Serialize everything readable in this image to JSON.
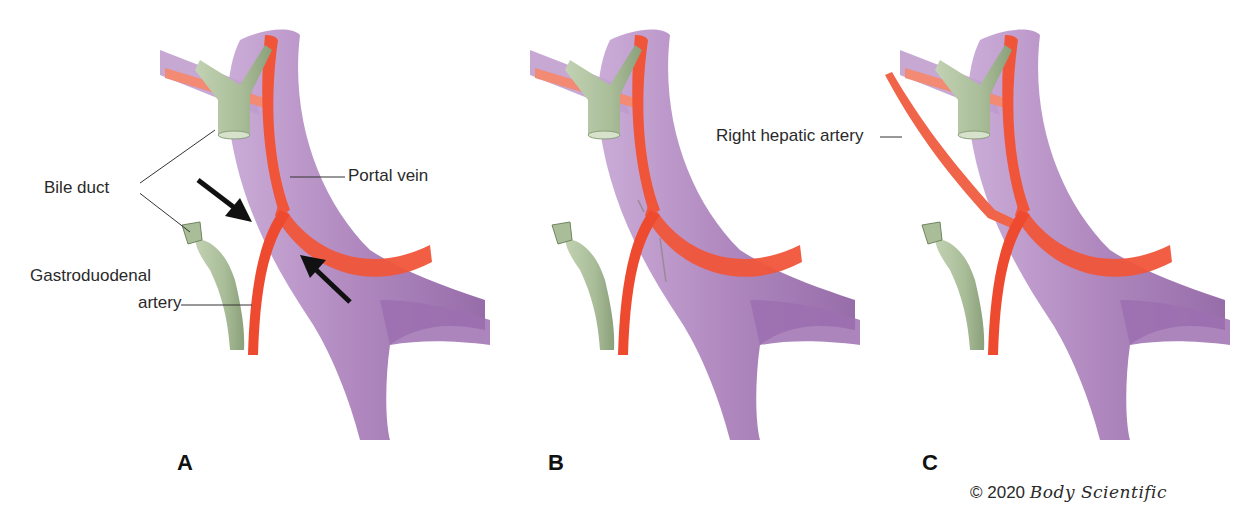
{
  "figure": {
    "panels": [
      {
        "letter": "A",
        "labels": {
          "bile_duct": "Bile duct",
          "portal_vein": "Portal vein",
          "gastroduodenal_line1": "Gastroduodenal",
          "gastroduodenal_line2": "artery"
        },
        "arrows": 2
      },
      {
        "letter": "B",
        "labels": {}
      },
      {
        "letter": "C",
        "labels": {
          "right_hepatic_artery": "Right hepatic artery"
        }
      }
    ],
    "colors": {
      "portal_vein": "#a77bb8",
      "portal_vein_dark": "#8b5d9f",
      "artery": "#f0553a",
      "artery_light": "#f28a74",
      "bile_duct": "#a9bd98",
      "bile_duct_dark": "#8aa07a",
      "leader_line": "#333333",
      "arrow": "#111111"
    },
    "copyright": {
      "symbol_year": "© 2020",
      "brand": "Body Scientific"
    }
  }
}
